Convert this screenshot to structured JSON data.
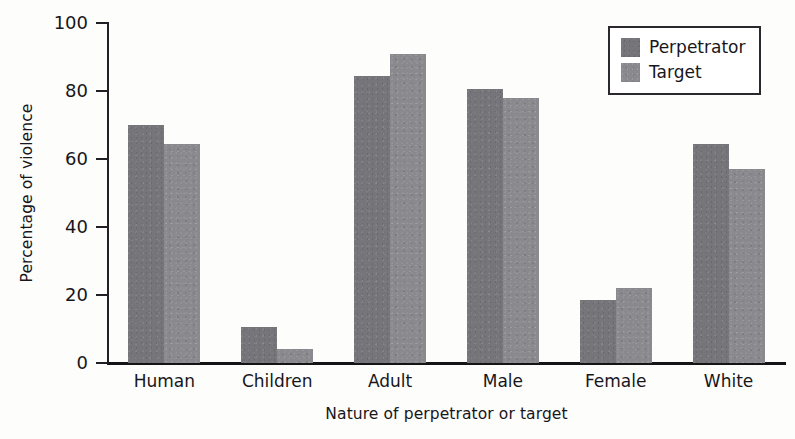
{
  "chart_data": {
    "type": "bar",
    "title": "",
    "xlabel": "Nature of perpetrator or target",
    "ylabel": "Percentage of violence",
    "categories": [
      "Human",
      "Children",
      "Adult",
      "Male",
      "Female",
      "White"
    ],
    "series": [
      {
        "name": "Perpetrator",
        "color": "#75757a",
        "values": [
          70,
          10.5,
          84.5,
          80.5,
          18.5,
          64.5
        ]
      },
      {
        "name": "Target",
        "color": "#8a8a8e",
        "values": [
          64.5,
          4,
          91,
          78,
          22,
          57
        ]
      }
    ],
    "ylim": [
      0,
      100
    ],
    "yticks": [
      0,
      20,
      40,
      60,
      80,
      100
    ],
    "ytick_labels": [
      "0",
      "20",
      "40",
      "60",
      "80",
      "100"
    ],
    "grid": false,
    "legend_position": "upper right",
    "legend_entries": [
      "Perpetrator",
      "Target"
    ],
    "annotations": []
  }
}
